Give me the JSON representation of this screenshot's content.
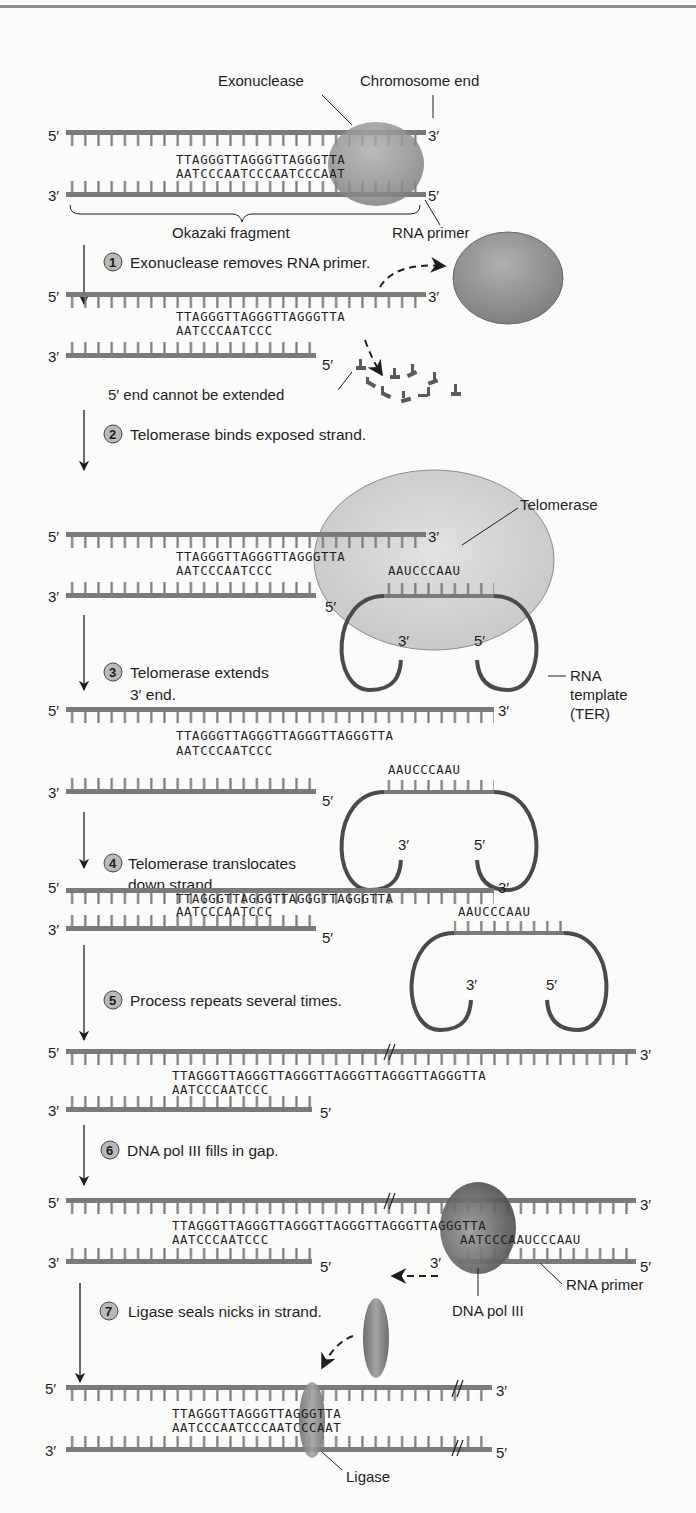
{
  "colors": {
    "strand": "#7a7a7a",
    "strand_dark": "#555555",
    "rna_loop": "#4a4a4a",
    "exonuclease": "#8e8e8e",
    "telomerase": "#cfcfcf",
    "dna_pol_iii": "#5d5d5d",
    "ligase": "#8a8a8a",
    "step_badge": "#b9b9b9"
  },
  "labels": {
    "five_prime": "5′",
    "three_prime": "3′",
    "exonuclease": "Exonuclease",
    "chromosome_end": "Chromosome end",
    "okazaki_fragment": "Okazaki fragment",
    "rna_primer": "RNA primer",
    "five_end_not_extended": "5′ end cannot be extended",
    "telomerase": "Telomerase",
    "rna_template_1": "RNA",
    "rna_template_2": "template",
    "rna_template_3": "(TER)",
    "dna_pol_iii": "DNA pol III",
    "ligase": "Ligase"
  },
  "steps": [
    {
      "num": "1",
      "text": "Exonuclease removes RNA primer."
    },
    {
      "num": "2",
      "text": "Telomerase binds exposed strand."
    },
    {
      "num": "3",
      "text": "Telomerase extends",
      "text2": "3′ end."
    },
    {
      "num": "4",
      "text": "Telomerase translocates",
      "text2": "down strand."
    },
    {
      "num": "5",
      "text": "Process repeats several times."
    },
    {
      "num": "6",
      "text": "DNA pol III fills in gap."
    },
    {
      "num": "7",
      "text": "Ligase seals nicks in strand."
    }
  ],
  "sequences": {
    "s0_top": "TTAGGGTTAGGGTTAGGGTTA",
    "s0_bottom": "AATCCCAATCCCAATCCCAAT",
    "s1_top": "TTAGGGTTAGGGTTAGGGTTA",
    "s1_bottom": "AATCCCAATCCC",
    "s2_top": "TTAGGGTTAGGGTTAGGGTTA",
    "s2_bottom": "AATCCCAATCCC",
    "s2_rna": "AAUCCCAAU",
    "s3_top": "TTAGGGTTAGGGTTAGGGTTAGGGTTA",
    "s3_bottom": "AATCCCAATCCC",
    "s3_rna": "AAUCCCAAU",
    "s4_top": "TTAGGGTTAGGGTTAGGGTTAGGGTTA",
    "s4_bottom": "AATCCCAATCCC",
    "s4_rna": "AAUCCCAAU",
    "s5_top": "TTAGGGTTAGGGTTAGGGTTAGGGTTAGGGTTAGGGTTA",
    "s5_bottom": "AATCCCAATCCC",
    "s6_top": "TTAGGGTTAGGGTTAGGGTTAGGGTTAGGGTTAGGGTTA",
    "s6_bottom_left": "AATCCCAATCCC",
    "s6_bottom_right": "AATCCCAAUCCCAAU",
    "s7_top": "TTAGGGTTAGGGTTAGGGTTA",
    "s7_bottom": "AATCCCAATCCCAATCCCAAT"
  }
}
